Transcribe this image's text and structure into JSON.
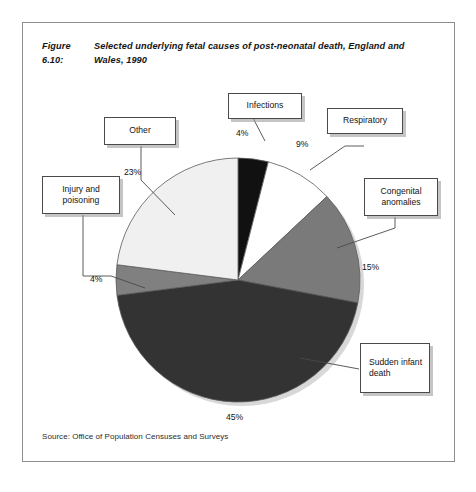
{
  "figure": {
    "number": "Figure 6.10:",
    "title": "Selected underlying fetal causes of post-neonatal death, England and Wales, 1990",
    "source": "Source: Office of Population Censuses and Surveys"
  },
  "labels": {
    "infections": "Infections",
    "respiratory": "Respiratory",
    "congenital": "Congenital anomalies",
    "sudden": "Sudden infant death",
    "other": "Other",
    "injury": "Injury and poisoning"
  },
  "percent_text": {
    "infections": "4%",
    "respiratory": "9%",
    "congenital": "15%",
    "sudden": "45%",
    "injury": "4%",
    "other": "23%"
  },
  "chart_data": {
    "type": "pie",
    "title": "Selected underlying fetal causes of post-neonatal death, England and Wales, 1990",
    "unit": "percent",
    "start_angle_deg": 0,
    "direction": "clockwise",
    "legend": "none",
    "labels": [
      "Infections",
      "Respiratory",
      "Congenital anomalies",
      "Sudden infant death",
      "Injury and poisoning",
      "Other"
    ],
    "values": [
      4,
      9,
      15,
      45,
      4,
      23
    ],
    "colors": [
      "#111111",
      "#ffffff",
      "#7a7a7a",
      "#333333",
      "#808080",
      "#f0f0f0"
    ],
    "slices": [
      {
        "label": "Infections",
        "value": 4,
        "color": "#111111"
      },
      {
        "label": "Respiratory",
        "value": 9,
        "color": "#ffffff"
      },
      {
        "label": "Congenital anomalies",
        "value": 15,
        "color": "#7a7a7a"
      },
      {
        "label": "Sudden infant death",
        "value": 45,
        "color": "#333333"
      },
      {
        "label": "Injury and poisoning",
        "value": 4,
        "color": "#808080"
      },
      {
        "label": "Other",
        "value": 23,
        "color": "#f0f0f0"
      }
    ]
  }
}
